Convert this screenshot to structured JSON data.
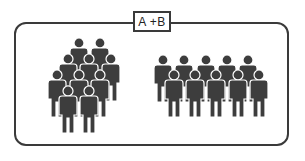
{
  "diagram": {
    "label": "A +B",
    "colors": {
      "figure": "#3d3d3d",
      "border": "#3a3a3a",
      "background": "#ffffff"
    },
    "groups": [
      {
        "name": "crowd-cluster",
        "count": 10,
        "rows": [
          2,
          3,
          3,
          2
        ]
      },
      {
        "name": "crowd-lineup",
        "count": 10,
        "rows": [
          5,
          5
        ]
      }
    ]
  }
}
